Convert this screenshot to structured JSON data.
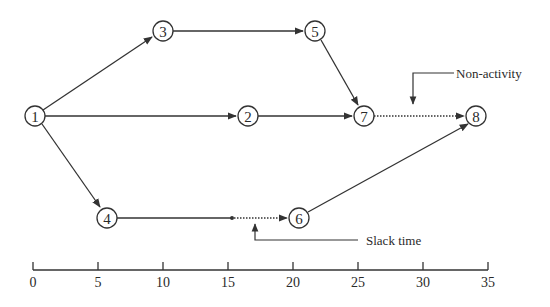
{
  "diagram": {
    "type": "activity-network-timeline",
    "nodes": [
      {
        "id": "1",
        "label": "1",
        "x": 35,
        "y": 116
      },
      {
        "id": "2",
        "label": "2",
        "x": 248,
        "y": 116
      },
      {
        "id": "3",
        "label": "3",
        "x": 163,
        "y": 31
      },
      {
        "id": "4",
        "label": "4",
        "x": 107,
        "y": 218
      },
      {
        "id": "5",
        "label": "5",
        "x": 315,
        "y": 31
      },
      {
        "id": "6",
        "label": "6",
        "x": 299,
        "y": 218
      },
      {
        "id": "7",
        "label": "7",
        "x": 364,
        "y": 116
      },
      {
        "id": "8",
        "label": "8",
        "x": 476,
        "y": 116
      }
    ],
    "edges": [
      {
        "from": "1",
        "to": "3",
        "style": "solid"
      },
      {
        "from": "1",
        "to": "2",
        "style": "solid"
      },
      {
        "from": "1",
        "to": "4",
        "style": "solid"
      },
      {
        "from": "3",
        "to": "5",
        "style": "solid"
      },
      {
        "from": "5",
        "to": "7",
        "style": "solid"
      },
      {
        "from": "2",
        "to": "7",
        "style": "solid"
      },
      {
        "from": "7",
        "to": "8",
        "style": "dotted"
      },
      {
        "from": "4",
        "to": "slack-point",
        "style": "solid"
      },
      {
        "from": "slack-point",
        "to": "6",
        "style": "dotted"
      },
      {
        "from": "6",
        "to": "8",
        "style": "solid"
      }
    ],
    "annotations": {
      "non_activity": "Non-activity",
      "slack_time": "Slack time"
    },
    "axis": {
      "min": 0,
      "max": 35,
      "step": 5,
      "ticks": [
        "0",
        "5",
        "10",
        "15",
        "20",
        "25",
        "30",
        "35"
      ]
    }
  }
}
